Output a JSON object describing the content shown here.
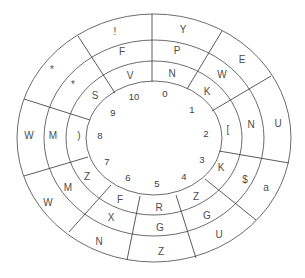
{
  "diagram": {
    "type": "cipher-wheel",
    "center": [
      154,
      138
    ],
    "rings": [
      {
        "name": "outer",
        "rx": 137,
        "ry": 124
      },
      {
        "name": "ring-2",
        "rx": 110,
        "ry": 98
      },
      {
        "name": "ring-3",
        "rx": 88,
        "ry": 77
      },
      {
        "name": "inner",
        "rx": 68,
        "ry": 57
      }
    ],
    "dividers": [
      {
        "x1": 152,
        "y1": 14,
        "x2": 152,
        "y2": 82
      },
      {
        "x1": 78,
        "y1": 36,
        "x2": 115,
        "y2": 93
      },
      {
        "x1": 222,
        "y1": 31,
        "x2": 187,
        "y2": 89
      },
      {
        "x1": 271,
        "y1": 76,
        "x2": 212,
        "y2": 111
      },
      {
        "x1": 24,
        "y1": 99,
        "x2": 90,
        "y2": 120
      },
      {
        "x1": 289,
        "y1": 163,
        "x2": 219,
        "y2": 151
      },
      {
        "x1": 24,
        "y1": 176,
        "x2": 88,
        "y2": 157
      },
      {
        "x1": 256,
        "y1": 220,
        "x2": 205,
        "y2": 179
      },
      {
        "x1": 111,
        "y1": 185,
        "x2": 69,
        "y2": 232
      },
      {
        "x1": 140,
        "y1": 196,
        "x2": 127,
        "y2": 260
      },
      {
        "x1": 176,
        "y1": 195,
        "x2": 196,
        "y2": 258
      }
    ],
    "outer_ring_labels": [
      {
        "text": "!",
        "x": 115,
        "y": 32
      },
      {
        "text": "Y",
        "x": 183,
        "y": 30
      },
      {
        "text": "E",
        "x": 242,
        "y": 60
      },
      {
        "text": "*",
        "x": 52,
        "y": 70
      },
      {
        "text": "U",
        "x": 278,
        "y": 124
      },
      {
        "text": "W",
        "x": 29,
        "y": 136
      },
      {
        "text": "a",
        "x": 266,
        "y": 188
      },
      {
        "text": "W",
        "x": 48,
        "y": 203
      },
      {
        "text": "U",
        "x": 219,
        "y": 235
      },
      {
        "text": "N",
        "x": 99,
        "y": 242
      },
      {
        "text": "Z",
        "x": 161,
        "y": 252
      }
    ],
    "middle_ring_labels": [
      {
        "text": "F",
        "x": 122,
        "y": 52
      },
      {
        "text": "P",
        "x": 177,
        "y": 51
      },
      {
        "text": "W",
        "x": 222,
        "y": 75
      },
      {
        "text": "*",
        "x": 73,
        "y": 85
      },
      {
        "text": "N",
        "x": 251,
        "y": 125
      },
      {
        "text": "M",
        "x": 53,
        "y": 136
      },
      {
        "text": "$",
        "x": 245,
        "y": 180
      },
      {
        "text": "M",
        "x": 68,
        "y": 188
      },
      {
        "text": "G",
        "x": 207,
        "y": 216
      },
      {
        "text": "X",
        "x": 111,
        "y": 218
      },
      {
        "text": "G",
        "x": 160,
        "y": 228
      }
    ],
    "inner_ring_labels": [
      {
        "text": "V",
        "x": 130,
        "y": 76
      },
      {
        "text": "N",
        "x": 172,
        "y": 74
      },
      {
        "text": "K",
        "x": 207,
        "y": 92
      },
      {
        "text": "S",
        "x": 95,
        "y": 96
      },
      {
        "text": "[",
        "x": 228,
        "y": 130
      },
      {
        "text": ")",
        "x": 79,
        "y": 136
      },
      {
        "text": "K",
        "x": 221,
        "y": 168
      },
      {
        "text": "Z",
        "x": 87,
        "y": 177
      },
      {
        "text": "Z",
        "x": 196,
        "y": 197
      },
      {
        "text": "F",
        "x": 120,
        "y": 200
      },
      {
        "text": "R",
        "x": 159,
        "y": 208
      }
    ],
    "numbers": [
      {
        "text": "10",
        "x": 134,
        "y": 97
      },
      {
        "text": "0",
        "x": 165,
        "y": 94
      },
      {
        "text": "1",
        "x": 192,
        "y": 110
      },
      {
        "text": "2",
        "x": 206,
        "y": 134
      },
      {
        "text": "3",
        "x": 202,
        "y": 160
      },
      {
        "text": "4",
        "x": 184,
        "y": 177
      },
      {
        "text": "5",
        "x": 157,
        "y": 184
      },
      {
        "text": "6",
        "x": 128,
        "y": 178
      },
      {
        "text": "7",
        "x": 107,
        "y": 162
      },
      {
        "text": "8",
        "x": 100,
        "y": 136
      },
      {
        "text": "9",
        "x": 113,
        "y": 113
      }
    ]
  }
}
